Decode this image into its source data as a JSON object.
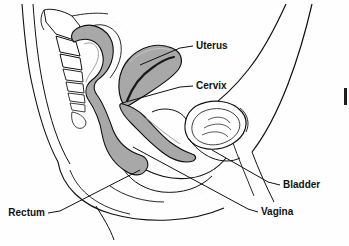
{
  "figure": {
    "kind": "anatomical-line-drawing",
    "background_color": "#fefefe",
    "ink_color": "#111111",
    "organ_fill_color": "#a8a8a8",
    "organ_fill_dark": "#8f8f8f",
    "stipple_color": "#b9b9b9"
  },
  "labels": [
    {
      "id": "uterus",
      "text": "Uterus",
      "x": 196,
      "y": 46,
      "align": "start",
      "leader": "M 193 46 L 180 48 L 140 65"
    },
    {
      "id": "cervix",
      "text": "Cervix",
      "x": 196,
      "y": 86,
      "align": "start",
      "leader": "M 193 86 L 180 87 L 122 103"
    },
    {
      "id": "bladder",
      "text": "Bladder",
      "x": 283,
      "y": 185,
      "align": "start",
      "leader": "M 280 185 L 268 182 L 212 150"
    },
    {
      "id": "vagina",
      "text": "Vagina",
      "x": 261,
      "y": 212,
      "align": "start",
      "leader": "M 258 212 L 248 209 L 133 147"
    },
    {
      "id": "rectum",
      "text": "Rectum",
      "x": 45,
      "y": 213,
      "align": "end",
      "leader": "M 48 213 L 60 211 L 140 170"
    }
  ],
  "artifact": {
    "id": "edge-mark",
    "description": "clipped scan mark at right edge",
    "x": 344,
    "y": 88,
    "width": 3,
    "height": 17
  }
}
